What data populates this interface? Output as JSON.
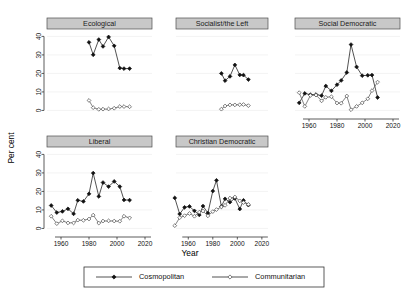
{
  "chart_data": {
    "type": "line",
    "title": "",
    "xlabel": "Year",
    "ylabel": "Per cent",
    "xlim": [
      1950,
      2025
    ],
    "ylim": [
      -3,
      44
    ],
    "xticks": [
      1960,
      1980,
      2000,
      2020
    ],
    "yticks": [
      0,
      10,
      20,
      30,
      40
    ],
    "grid": true,
    "legend_position": "bottom",
    "legend": [
      {
        "name": "Cosmopolitan",
        "marker": "filled-diamond",
        "color": "#111111"
      },
      {
        "name": "Communitarian",
        "marker": "open-diamond",
        "color": "#555555"
      }
    ],
    "panel_layout": {
      "rows": 2,
      "cols": 3
    },
    "panels": [
      {
        "label": "Ecological",
        "row": 0,
        "col": 0,
        "series": [
          {
            "name": "Cosmopolitan",
            "x": [
              1980,
              1983,
              1987,
              1990,
              1994,
              1998,
              2002,
              2005,
              2009
            ],
            "values": [
              36.8,
              30.1,
              38.3,
              34.6,
              39.7,
              34.9,
              22.9,
              22.6,
              22.6
            ]
          },
          {
            "name": "Communitarian",
            "x": [
              1980,
              1983,
              1987,
              1990,
              1994,
              1998,
              2002,
              2005,
              2009
            ],
            "values": [
              5.4,
              1.5,
              0.6,
              0.7,
              0.8,
              1.2,
              2.1,
              2.1,
              2.0
            ]
          }
        ]
      },
      {
        "label": "Socialist/the Left",
        "row": 0,
        "col": 1,
        "series": [
          {
            "name": "Cosmopolitan",
            "x": [
              1987,
              1990,
              1994,
              1998,
              2002,
              2005,
              2009
            ],
            "values": [
              20.0,
              16.1,
              18.4,
              24.6,
              19.2,
              19.1,
              16.7
            ]
          },
          {
            "name": "Communitarian",
            "x": [
              1987,
              1990,
              1994,
              1998,
              2002,
              2005,
              2009
            ],
            "values": [
              0.7,
              2.4,
              3.0,
              3.0,
              3.1,
              3.2,
              2.6
            ]
          }
        ]
      },
      {
        "label": "Social Democratic",
        "row": 0,
        "col": 2,
        "series": [
          {
            "name": "Cosmopolitan",
            "x": [
              1953,
              1957,
              1961,
              1965,
              1969,
              1972,
              1976,
              1980,
              1983,
              1987,
              1990,
              1994,
              1998,
              2002,
              2005,
              2009
            ],
            "values": [
              4.1,
              9.2,
              8.5,
              8.6,
              8.0,
              13.2,
              10.6,
              13.9,
              16.2,
              20.5,
              35.6,
              23.5,
              18.8,
              19.0,
              19.1,
              7.0
            ]
          },
          {
            "name": "Communitarian",
            "x": [
              1953,
              1957,
              1961,
              1965,
              1969,
              1972,
              1976,
              1980,
              1983,
              1987,
              1990,
              1994,
              1998,
              2002,
              2005,
              2009
            ],
            "values": [
              9.6,
              2.2,
              8.1,
              8.3,
              5.2,
              7.1,
              7.4,
              4.0,
              3.9,
              7.8,
              0.4,
              2.2,
              4.1,
              6.3,
              10.7,
              15.3
            ]
          }
        ]
      },
      {
        "label": "Liberal",
        "row": 1,
        "col": 0,
        "series": [
          {
            "name": "Cosmopolitan",
            "x": [
              1953,
              1957,
              1961,
              1965,
              1969,
              1972,
              1976,
              1980,
              1983,
              1987,
              1990,
              1994,
              1998,
              2002,
              2005,
              2009
            ],
            "values": [
              12.4,
              8.6,
              9.2,
              10.6,
              7.9,
              15.2,
              14.6,
              18.7,
              29.9,
              17.3,
              24.8,
              22.6,
              25.4,
              22.6,
              15.4,
              15.3
            ]
          },
          {
            "name": "Communitarian",
            "x": [
              1953,
              1957,
              1961,
              1965,
              1969,
              1972,
              1976,
              1980,
              1983,
              1987,
              1990,
              1994,
              1998,
              2002,
              2005,
              2009
            ],
            "values": [
              6.6,
              2.6,
              4.1,
              3.0,
              3.0,
              4.5,
              4.4,
              5.1,
              7.2,
              2.9,
              4.0,
              4.1,
              4.0,
              3.9,
              6.6,
              5.7
            ]
          }
        ]
      },
      {
        "label": "Christian Democratic",
        "row": 1,
        "col": 1,
        "series": [
          {
            "name": "Cosmopolitan",
            "x": [
              1949,
              1953,
              1957,
              1961,
              1965,
              1969,
              1972,
              1976,
              1980,
              1983,
              1987,
              1990,
              1994,
              1998,
              2002,
              2005,
              2009
            ],
            "values": [
              16.5,
              7.8,
              11.4,
              11.9,
              9.5,
              7.3,
              12.1,
              8.3,
              20.2,
              26.0,
              11.9,
              16.0,
              14.2,
              16.2,
              10.5,
              15.2,
              12.6
            ]
          },
          {
            "name": "Communitarian",
            "x": [
              1949,
              1953,
              1957,
              1961,
              1965,
              1969,
              1972,
              1976,
              1980,
              1983,
              1987,
              1990,
              1994,
              1998,
              2002,
              2005,
              2009
            ],
            "values": [
              1.5,
              5.8,
              6.9,
              8.1,
              6.6,
              8.8,
              9.4,
              6.8,
              9.1,
              10.2,
              11.6,
              12.5,
              16.4,
              17.0,
              14.9,
              14.0,
              13.0
            ]
          }
        ]
      }
    ]
  }
}
